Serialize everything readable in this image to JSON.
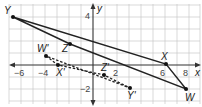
{
  "diagram": {
    "type": "coordinate-plane-transformation",
    "axes": {
      "x_label": "x",
      "y_label": "y",
      "x_ticks": [
        "−6",
        "−4",
        "2",
        "6",
        "8"
      ],
      "y_ticks": [
        "4",
        "−2"
      ]
    },
    "original_figure": {
      "style": "solid",
      "vertices": [
        {
          "name": "Y",
          "label": "Y"
        },
        {
          "name": "X",
          "label": "X"
        },
        {
          "name": "W",
          "label": "W"
        },
        {
          "name": "Z",
          "label": "Z"
        }
      ]
    },
    "image_figure": {
      "style": "dashed",
      "vertices": [
        {
          "name": "W'",
          "label": "W'"
        },
        {
          "name": "X'",
          "label": "X'"
        },
        {
          "name": "Z'",
          "label": "Z'"
        },
        {
          "name": "Y'",
          "label": "Y'"
        }
      ]
    }
  }
}
